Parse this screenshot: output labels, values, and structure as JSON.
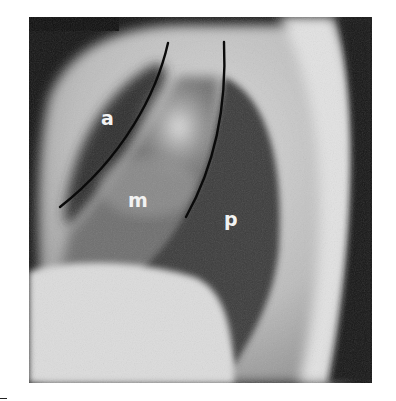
{
  "figure": {
    "labels": {
      "anterior": "a",
      "middle": "m",
      "posterior": "p"
    },
    "colors": {
      "background": "#ffffff",
      "film_dark": "#111111",
      "boundary_lines": "#0a0a0a",
      "label_text": "#f2f2f2"
    }
  }
}
